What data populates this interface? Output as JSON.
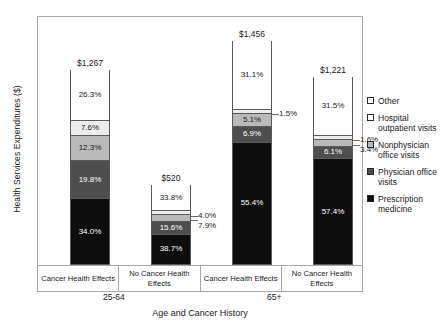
{
  "chart_data": {
    "type": "bar",
    "subtype": "stacked-bar-100-percent",
    "title": "",
    "xlabel": "Age and Cancer History",
    "ylabel": "Health Services Expenditures ($)",
    "grid": false,
    "legend_position": "right",
    "ylim": [
      0,
      1456
    ],
    "categories": [
      "Cancer Health Effects",
      "No Cancer Health Effects",
      "Cancer Health Effects",
      "No Cancer Health Effects"
    ],
    "groups": [
      {
        "label": "25-64",
        "categories": [
          0,
          1
        ]
      },
      {
        "label": "65+",
        "categories": [
          2,
          3
        ]
      }
    ],
    "totals": [
      1267,
      520,
      1456,
      1221
    ],
    "total_labels": [
      "$1,267",
      "$520",
      "$1,456",
      "$1,221"
    ],
    "series": [
      {
        "name": "Other",
        "color": "#ffffff",
        "values": [
          26.3,
          33.8,
          31.1,
          31.5
        ],
        "labels": [
          "26.3%",
          "33.8%",
          "31.1%",
          "31.5%"
        ]
      },
      {
        "name": "Hospital outpatient visits",
        "color": "#ececec",
        "values": [
          7.6,
          4.0,
          1.5,
          1.6
        ],
        "labels": [
          "7.6%",
          "4.0%",
          "1.5%",
          "1.6%"
        ]
      },
      {
        "name": "Nonphysician office visits",
        "color": "#b9b9b9",
        "values": [
          12.3,
          7.9,
          5.1,
          3.4
        ],
        "labels": [
          "12.3%",
          "7.9%",
          "5.1%",
          "3.4%"
        ]
      },
      {
        "name": "Physician office visits",
        "color": "#4e4e4e",
        "values": [
          19.8,
          15.6,
          6.9,
          6.1
        ],
        "labels": [
          "19.8%",
          "15.6%",
          "6.9%",
          "6.1%"
        ]
      },
      {
        "name": "Prescription medicine",
        "color": "#0d0d0d",
        "values": [
          34.0,
          38.7,
          55.4,
          57.4
        ],
        "labels": [
          "34.0%",
          "38.7%",
          "55.4%",
          "57.4%"
        ]
      }
    ]
  },
  "axes": {
    "ylabel": "Health Services Expenditures ($)",
    "xlabel": "Age and Cancer History"
  },
  "xaxis": {
    "cells": [
      "Cancer Health Effects",
      "No Cancer Health Effects",
      "Cancer Health Effects",
      "No Cancer Health Effects"
    ],
    "groups": [
      "25-64",
      "65+"
    ]
  },
  "bars": [
    {
      "total": "$1,267",
      "segments": [
        {
          "key": "other",
          "label": "26.3%",
          "inside": true
        },
        {
          "key": "hosp",
          "label": "7.6%",
          "inside": true
        },
        {
          "key": "nonphys",
          "label": "12.3%",
          "inside": true
        },
        {
          "key": "phys",
          "label": "19.8%",
          "inside": true
        },
        {
          "key": "presc",
          "label": "34.0%",
          "inside": true
        }
      ]
    },
    {
      "total": "$520",
      "segments": [
        {
          "key": "other",
          "label": "33.8%",
          "inside": true
        },
        {
          "key": "hosp",
          "label": "4.0%",
          "inside": false
        },
        {
          "key": "nonphys",
          "label": "7.9%",
          "inside": false
        },
        {
          "key": "phys",
          "label": "15.6%",
          "inside": true
        },
        {
          "key": "presc",
          "label": "38.7%",
          "inside": true
        }
      ]
    },
    {
      "total": "$1,456",
      "segments": [
        {
          "key": "other",
          "label": "31.1%",
          "inside": true
        },
        {
          "key": "hosp",
          "label": "1.5%",
          "inside": false
        },
        {
          "key": "nonphys",
          "label": "5.1%",
          "inside": true
        },
        {
          "key": "phys",
          "label": "6.9%",
          "inside": true
        },
        {
          "key": "presc",
          "label": "55.4%",
          "inside": true
        }
      ]
    },
    {
      "total": "$1,221",
      "segments": [
        {
          "key": "other",
          "label": "31.5%",
          "inside": true
        },
        {
          "key": "hosp",
          "label": "1.6%",
          "inside": false
        },
        {
          "key": "nonphys",
          "label": "3.4%",
          "inside": false
        },
        {
          "key": "phys",
          "label": "6.1%",
          "inside": true
        },
        {
          "key": "presc",
          "label": "57.4%",
          "inside": true
        }
      ]
    }
  ],
  "legend": {
    "items": [
      {
        "label": "Other",
        "color": "#ffffff"
      },
      {
        "label": "Hospital outpatient visits",
        "color": "#ffffff"
      },
      {
        "label": "Nonphysician office visits",
        "color": "#b9b9b9"
      },
      {
        "label": "Physician office visits",
        "color": "#4e4e4e"
      },
      {
        "label": "Prescription medicine",
        "color": "#0d0d0d"
      }
    ]
  }
}
